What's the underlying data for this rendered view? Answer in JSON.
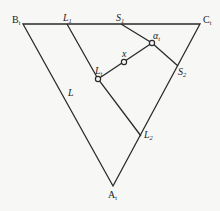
{
  "diagram": {
    "type": "ternary-phase-diagram",
    "vertices": {
      "B": {
        "label": "B",
        "sub": "t"
      },
      "C": {
        "label": "C",
        "sub": "t"
      },
      "A": {
        "label": "A",
        "sub": "t"
      }
    },
    "points": {
      "L1": {
        "label": "L",
        "sub": "1"
      },
      "S1": {
        "label": "S",
        "sub": "1"
      },
      "alpha": {
        "label": "α",
        "sub": "t"
      },
      "x": {
        "label": "x"
      },
      "Lt": {
        "label": "L",
        "sub": "t"
      },
      "S2": {
        "label": "S",
        "sub": "2"
      },
      "L2": {
        "label": "L",
        "sub": "2"
      },
      "L": {
        "label": "L"
      }
    },
    "colors": {
      "line": "#2a2a2a",
      "background": "#f7f7f5"
    }
  }
}
